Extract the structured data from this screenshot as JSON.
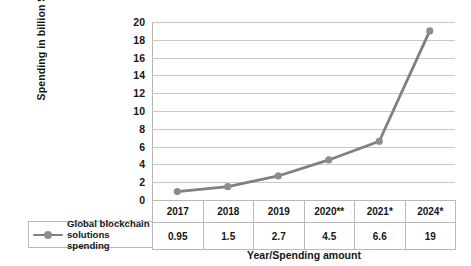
{
  "chart_data": {
    "type": "line",
    "title": "",
    "xlabel": "Year/Spending amount",
    "ylabel": "Spending in billion $",
    "categories": [
      "2017",
      "2018",
      "2019",
      "2020**",
      "2021*",
      "2024*"
    ],
    "values": [
      0.95,
      1.5,
      2.7,
      4.5,
      6.6,
      19
    ],
    "value_labels": [
      "0.95",
      "1.5",
      "2.7",
      "4.5",
      "6.6",
      "19"
    ],
    "series": [
      {
        "name": "Global blockchain solutions spending",
        "values": [
          0.95,
          1.5,
          2.7,
          4.5,
          6.6,
          19
        ]
      }
    ],
    "ylim": [
      0,
      20
    ],
    "ytick_step": 2,
    "yticks": [
      "20",
      "18",
      "16",
      "14",
      "12",
      "10",
      "8",
      "6",
      "4",
      "2",
      "0"
    ],
    "grid": true,
    "legend_position": "table-left",
    "line_color": "#808080",
    "marker_color": "#8d8d8d",
    "gridline_color": "#c8c8c8",
    "table_border_color": "#b9b9b9"
  },
  "legend": {
    "name_line1": "Global blockchain",
    "name_line2": "solutions spending"
  },
  "table": {
    "header": [
      "2017",
      "2018",
      "2019",
      "2020**",
      "2021*",
      "2024*"
    ],
    "values": [
      "0.95",
      "1.5",
      "2.7",
      "4.5",
      "6.6",
      "19"
    ]
  }
}
